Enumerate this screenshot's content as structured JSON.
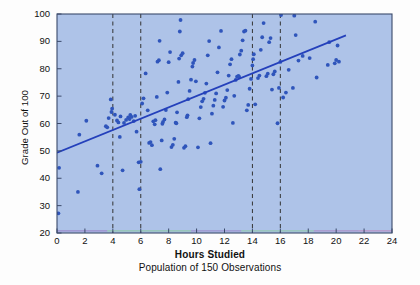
{
  "chart_data": {
    "type": "scatter",
    "title": "",
    "xlabel": "Hours Studied",
    "subtitle": "Population of 150 Observations",
    "ylabel": "Grade Out of 100",
    "xlim": [
      0,
      24
    ],
    "ylim": [
      20,
      100
    ],
    "xticks": [
      0,
      2,
      4,
      6,
      8,
      10,
      12,
      14,
      16,
      18,
      20,
      22,
      24
    ],
    "yticks": [
      20,
      30,
      40,
      50,
      60,
      70,
      80,
      90,
      100
    ],
    "grid": false,
    "legend": "none",
    "plot_background_color": "#aec3e8",
    "point_color": "#2f55bb",
    "trend_line_color": "#2440bb",
    "axis_color": "#3b4a6b",
    "reference_lines": {
      "orientation": "vertical",
      "style": "dashed",
      "color": "#333333",
      "x_values": [
        4,
        6,
        14,
        16
      ]
    },
    "trend_line": {
      "x_start": 0,
      "y_start": 49.3,
      "x_end": 20.7,
      "y_end": 92.2
    },
    "n_observations": 150,
    "points": [
      [
        0.1,
        27.2
      ],
      [
        0.15,
        43.8
      ],
      [
        1.5,
        35.0
      ],
      [
        1.6,
        55.9
      ],
      [
        2.1,
        61.0
      ],
      [
        2.9,
        44.6
      ],
      [
        3.2,
        41.8
      ],
      [
        3.5,
        59.0
      ],
      [
        3.6,
        58.6
      ],
      [
        3.7,
        62.0
      ],
      [
        3.85,
        68.8
      ],
      [
        3.95,
        65.4
      ],
      [
        3.9,
        64.2
      ],
      [
        4.15,
        63.2
      ],
      [
        4.3,
        61.1
      ],
      [
        4.4,
        60.4
      ],
      [
        4.5,
        55.1
      ],
      [
        4.55,
        62.6
      ],
      [
        4.7,
        42.9
      ],
      [
        4.8,
        60.2
      ],
      [
        4.95,
        61.3
      ],
      [
        5.1,
        62.2
      ],
      [
        5.2,
        61.6
      ],
      [
        5.25,
        63.1
      ],
      [
        5.35,
        62.4
      ],
      [
        5.5,
        60.9
      ],
      [
        5.6,
        62.8
      ],
      [
        5.7,
        57.0
      ],
      [
        5.85,
        45.8
      ],
      [
        5.9,
        36.0
      ],
      [
        6.0,
        46.0
      ],
      [
        6.1,
        67.3
      ],
      [
        6.2,
        69.2
      ],
      [
        6.35,
        78.3
      ],
      [
        6.5,
        64.8
      ],
      [
        6.6,
        52.9
      ],
      [
        6.7,
        53.2
      ],
      [
        6.8,
        52.1
      ],
      [
        6.9,
        60.8
      ],
      [
        7.0,
        59.7
      ],
      [
        7.05,
        61.2
      ],
      [
        7.15,
        69.7
      ],
      [
        7.2,
        82.6
      ],
      [
        7.3,
        83.1
      ],
      [
        7.35,
        90.2
      ],
      [
        7.4,
        43.3
      ],
      [
        7.5,
        53.8
      ],
      [
        7.55,
        59.9
      ],
      [
        7.6,
        60.6
      ],
      [
        7.7,
        61.5
      ],
      [
        7.8,
        64.9
      ],
      [
        7.9,
        71.3
      ],
      [
        8.0,
        82.4
      ],
      [
        8.1,
        86.1
      ],
      [
        8.2,
        51.4
      ],
      [
        8.3,
        52.2
      ],
      [
        8.4,
        54.4
      ],
      [
        8.5,
        60.3
      ],
      [
        8.55,
        60.1
      ],
      [
        8.6,
        64.1
      ],
      [
        8.7,
        75.2
      ],
      [
        8.75,
        83.7
      ],
      [
        8.8,
        93.6
      ],
      [
        8.85,
        97.8
      ],
      [
        8.9,
        84.9
      ],
      [
        9.0,
        85.7
      ],
      [
        9.1,
        51.1
      ],
      [
        9.2,
        51.7
      ],
      [
        9.3,
        62.3
      ],
      [
        9.35,
        63.0
      ],
      [
        9.4,
        68.9
      ],
      [
        9.5,
        71.9
      ],
      [
        9.6,
        76.0
      ],
      [
        9.7,
        80.8
      ],
      [
        9.75,
        82.1
      ],
      [
        9.85,
        83.2
      ],
      [
        9.95,
        75.4
      ],
      [
        10.1,
        51.3
      ],
      [
        10.2,
        61.9
      ],
      [
        10.3,
        66.0
      ],
      [
        10.4,
        68.1
      ],
      [
        10.5,
        69.0
      ],
      [
        10.6,
        71.2
      ],
      [
        10.7,
        74.6
      ],
      [
        10.8,
        84.9
      ],
      [
        10.9,
        90.1
      ],
      [
        11.0,
        52.8
      ],
      [
        11.1,
        63.6
      ],
      [
        11.2,
        66.5
      ],
      [
        11.3,
        68.6
      ],
      [
        11.4,
        71.0
      ],
      [
        11.5,
        78.7
      ],
      [
        11.6,
        87.8
      ],
      [
        11.75,
        93.8
      ],
      [
        11.9,
        66.1
      ],
      [
        12.0,
        68.4
      ],
      [
        12.1,
        69.4
      ],
      [
        12.2,
        72.2
      ],
      [
        12.3,
        77.5
      ],
      [
        12.4,
        81.6
      ],
      [
        12.5,
        83.5
      ],
      [
        12.6,
        60.2
      ],
      [
        12.7,
        70.1
      ],
      [
        12.8,
        75.9
      ],
      [
        12.9,
        77.1
      ],
      [
        13.0,
        77.4
      ],
      [
        13.05,
        77.0
      ],
      [
        13.1,
        85.2
      ],
      [
        13.2,
        86.6
      ],
      [
        13.3,
        90.4
      ],
      [
        13.4,
        93.6
      ],
      [
        13.5,
        93.9
      ],
      [
        13.6,
        64.8
      ],
      [
        13.7,
        66.8
      ],
      [
        13.8,
        72.7
      ],
      [
        13.9,
        76.3
      ],
      [
        14.0,
        81.2
      ],
      [
        14.05,
        83.5
      ],
      [
        14.1,
        85.3
      ],
      [
        14.2,
        67.0
      ],
      [
        14.4,
        76.6
      ],
      [
        14.5,
        77.5
      ],
      [
        14.6,
        86.9
      ],
      [
        14.7,
        91.5
      ],
      [
        14.8,
        96.7
      ],
      [
        15.0,
        77.3
      ],
      [
        15.1,
        78.2
      ],
      [
        15.2,
        89.7
      ],
      [
        15.3,
        91.2
      ],
      [
        15.4,
        72.4
      ],
      [
        15.5,
        78.0
      ],
      [
        15.6,
        79.0
      ],
      [
        15.8,
        60.1
      ],
      [
        15.9,
        73.0
      ],
      [
        16.0,
        82.5
      ],
      [
        16.05,
        99.6
      ],
      [
        16.2,
        69.5
      ],
      [
        16.4,
        71.3
      ],
      [
        16.6,
        79.6
      ],
      [
        16.9,
        73.0
      ],
      [
        17.0,
        99.4
      ],
      [
        17.1,
        92.3
      ],
      [
        17.3,
        83.0
      ],
      [
        17.6,
        84.7
      ],
      [
        18.1,
        83.9
      ],
      [
        18.5,
        97.2
      ],
      [
        18.6,
        76.8
      ],
      [
        19.4,
        81.4
      ],
      [
        19.5,
        89.7
      ],
      [
        19.9,
        82.0
      ],
      [
        20.0,
        83.2
      ],
      [
        20.1,
        88.5
      ],
      [
        20.2,
        82.6
      ]
    ]
  }
}
